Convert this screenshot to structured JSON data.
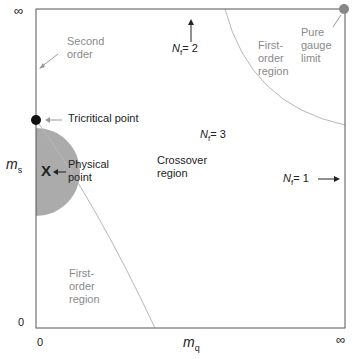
{
  "diagram": {
    "type": "phase-diagram",
    "x_axis": {
      "label_main": "m",
      "label_sub": "q",
      "tick_min": "0",
      "tick_max": "∞"
    },
    "y_axis": {
      "label_main": "m",
      "label_sub": "s",
      "tick_min": "0",
      "tick_max": "∞"
    },
    "labels": {
      "second_order": [
        "Second",
        "order"
      ],
      "tricritical": "Tricritical point",
      "physical_point": [
        "Physical",
        "point"
      ],
      "physical_marker": "X",
      "crossover": [
        "Crossover",
        "region"
      ],
      "first_order_top": [
        "First-",
        "order",
        "region"
      ],
      "first_order_bottom": [
        "First-",
        "order",
        "region"
      ],
      "pure_gauge": [
        "Pure",
        "gauge",
        "limit"
      ],
      "nf2": {
        "main": "N",
        "sub": "f",
        "rest": "= 2"
      },
      "nf3": {
        "main": "N",
        "sub": "f",
        "rest": "= 3"
      },
      "nf1": {
        "main": "N",
        "sub": "f",
        "rest": "= 1"
      }
    },
    "colors": {
      "axis": "#555555",
      "curve": "#b0b0b0",
      "shade": "#a9a9a9",
      "point_black": "#111111",
      "point_gray": "#888888"
    }
  }
}
